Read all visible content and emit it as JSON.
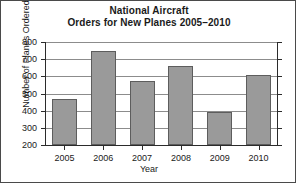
{
  "chart_data": {
    "type": "bar",
    "title": "National Aircraft\nOrders for New Planes 2005–2010",
    "title_lines": [
      "National Aircraft",
      "Orders for New Planes 2005–2010"
    ],
    "categories": [
      "2005",
      "2006",
      "2007",
      "2008",
      "2009",
      "2010"
    ],
    "values": [
      470,
      750,
      575,
      660,
      390,
      610
    ],
    "xlabel": "Year",
    "ylabel": "Number of Planes Ordered",
    "ylim": [
      200,
      800
    ],
    "ytick_labels": [
      "200",
      "300",
      "400",
      "500",
      "600",
      "700",
      "800"
    ],
    "ytick_values": [
      200,
      300,
      400,
      500,
      600,
      700,
      800
    ],
    "grid": true,
    "legend": false,
    "bar_color": "#9a9a9a",
    "bar_edge_color": "#5d5d5d",
    "grid_color": "#8c8c8c",
    "axis_color": "#2b2b2b",
    "background_color": "#ffffff"
  }
}
